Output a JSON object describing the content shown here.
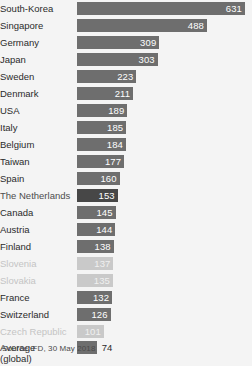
{
  "source_note": "Source: FD, 30 May 2018",
  "chart_data": {
    "type": "bar",
    "orientation": "horizontal",
    "title": "",
    "subtitle": "",
    "xlabel": "",
    "ylabel": "",
    "grid": false,
    "legend": null,
    "xlim": [
      0,
      631
    ],
    "value_label_position": "inside-bar-right",
    "categories": [
      "South-Korea",
      "Singapore",
      "Germany",
      "Japan",
      "Sweden",
      "Denmark",
      "USA",
      "Italy",
      "Belgium",
      "Taiwan",
      "Spain",
      "The Netherlands",
      "Canada",
      "Austria",
      "Finland",
      "Slovenia",
      "Slovakia",
      "France",
      "Switzerland",
      "Czech Republic",
      "Average\n(global)"
    ],
    "values": [
      631,
      488,
      309,
      303,
      223,
      211,
      189,
      185,
      184,
      177,
      160,
      153,
      145,
      144,
      138,
      137,
      135,
      132,
      126,
      101,
      74
    ],
    "styles": [
      "normal",
      "normal",
      "normal",
      "normal",
      "normal",
      "normal",
      "normal",
      "normal",
      "normal",
      "normal",
      "normal",
      "highlight",
      "normal",
      "normal",
      "normal",
      "faded",
      "faded",
      "normal",
      "normal",
      "faded",
      "normal"
    ],
    "label_outside": [
      false,
      false,
      false,
      false,
      false,
      false,
      false,
      false,
      false,
      false,
      false,
      false,
      false,
      false,
      false,
      false,
      false,
      false,
      false,
      false,
      true
    ],
    "colors": {
      "bar_normal": "#6e6e6e",
      "bar_highlight": "#474747",
      "bar_faded": "#c9c9c9",
      "background": "#f4f4f4",
      "label_text": "#2b2b2b",
      "label_faded": "#c4c4c4",
      "value_text_inside": "#ffffff"
    }
  }
}
